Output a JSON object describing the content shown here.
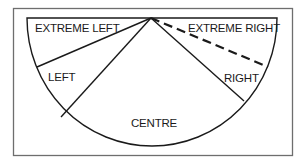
{
  "diagram": {
    "type": "semicircle-spectrum",
    "segments": [
      {
        "id": "extreme-left",
        "label": "EXTREME LEFT"
      },
      {
        "id": "left",
        "label": "LEFT"
      },
      {
        "id": "centre",
        "label": "CENTRE"
      },
      {
        "id": "right",
        "label": "RIGHT"
      },
      {
        "id": "extreme-right",
        "label": "EXTREME RIGHT"
      }
    ],
    "dividers": [
      {
        "between": [
          "extreme-left",
          "left"
        ],
        "style": "solid"
      },
      {
        "between": [
          "left",
          "centre"
        ],
        "style": "solid"
      },
      {
        "between": [
          "centre",
          "right"
        ],
        "style": "solid"
      },
      {
        "between": [
          "right",
          "extreme-right"
        ],
        "style": "dashed"
      }
    ],
    "colors": {
      "stroke": "#1a1a1a",
      "frame": "#6e6e6e",
      "background": "#ffffff"
    }
  }
}
